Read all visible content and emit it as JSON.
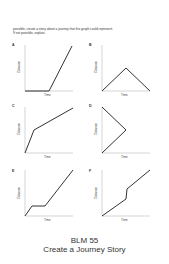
{
  "instructions": {
    "line1": "possible, create a story about a journey that the graph could represent.",
    "line2": "If not possible, explain."
  },
  "axes": {
    "xlabel": "Time",
    "ylabel": "Distance"
  },
  "graphs": [
    {
      "letter": "A",
      "description": "flat at zero, then steep rise",
      "points": [
        [
          0,
          0
        ],
        [
          0.5,
          0
        ],
        [
          1,
          1
        ]
      ]
    },
    {
      "letter": "B",
      "description": "rise to peak then fall to zero",
      "points": [
        [
          0,
          0
        ],
        [
          0.5,
          0.5
        ],
        [
          1,
          0
        ]
      ]
    },
    {
      "letter": "C",
      "description": "steep rise then gentler rise",
      "points": [
        [
          0,
          0
        ],
        [
          0.2,
          0.5
        ],
        [
          1,
          1
        ]
      ]
    },
    {
      "letter": "D",
      "description": "invalid: goes back in time",
      "points": [
        [
          0,
          1
        ],
        [
          0.5,
          0.5
        ],
        [
          0,
          0
        ]
      ]
    },
    {
      "letter": "E",
      "description": "rise, flat, then steady rise",
      "points": [
        [
          0,
          0
        ],
        [
          0.15,
          0.22
        ],
        [
          0.4,
          0.22
        ],
        [
          1,
          1
        ]
      ]
    },
    {
      "letter": "F",
      "description": "steady rise with vertical jump",
      "points": [
        [
          0,
          0
        ],
        [
          0.5,
          0.37
        ],
        [
          0.52,
          0.58
        ],
        [
          1,
          1
        ]
      ]
    }
  ],
  "footer": {
    "code": "BLM 55",
    "title": "Create a Journey Story"
  }
}
